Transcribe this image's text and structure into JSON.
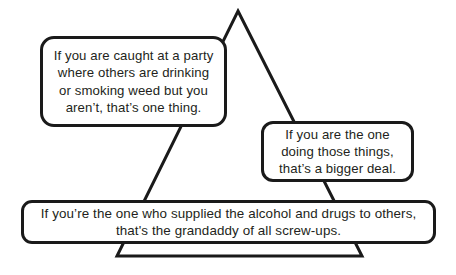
{
  "diagram": {
    "shape": {
      "name": "triangle",
      "stroke_color": "#1a1a1a",
      "stroke_width": 3,
      "fill_color": "#ffffff",
      "apex": {
        "x": 238,
        "y": 11
      },
      "base_left": {
        "x": 117,
        "y": 256
      },
      "base_right": {
        "x": 362,
        "y": 256
      }
    },
    "callouts": [
      {
        "id": "top-left",
        "text": "If you are caught at a party\nwhere others are drinking\nor smoking weed but you\naren’t, that’s one thing.",
        "border_color": "#1a1a1a",
        "fill_color": "#ffffff",
        "text_color": "#231f20"
      },
      {
        "id": "middle-right",
        "text": "If you are the one\ndoing those things,\nthat’s a bigger deal.",
        "border_color": "#1a1a1a",
        "fill_color": "#ffffff",
        "text_color": "#231f20"
      },
      {
        "id": "bottom",
        "text": "If you’re the one who supplied the alcohol and drugs to others,\nthat's the grandaddy of all screw-ups.",
        "border_color": "#1a1a1a",
        "fill_color": "#ffffff",
        "text_color": "#231f20"
      }
    ]
  }
}
